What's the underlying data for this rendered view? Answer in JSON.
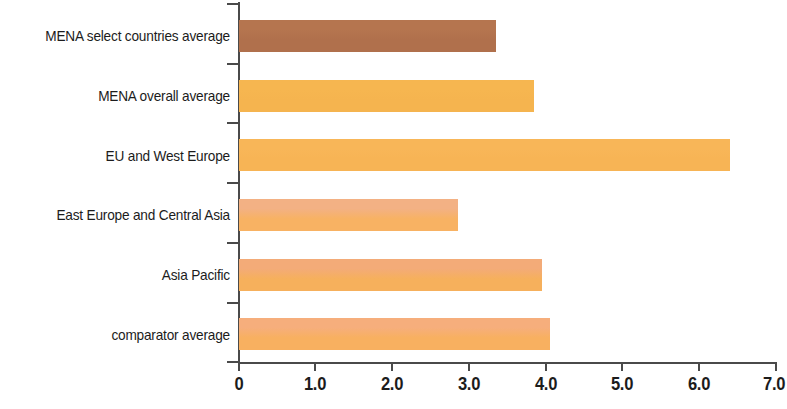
{
  "chart_data": {
    "type": "bar",
    "orientation": "horizontal",
    "title": "",
    "subtitle": "",
    "xlabel": "",
    "ylabel": "",
    "xlim": [
      0,
      7.0
    ],
    "grid": false,
    "legend": "none",
    "xticks": [
      "0",
      "1.0",
      "2.0",
      "3.0",
      "4.0",
      "5.0",
      "6.0",
      "7.0"
    ],
    "xtick_values": [
      0,
      1.0,
      2.0,
      3.0,
      4.0,
      5.0,
      6.0,
      7.0
    ],
    "categories": [
      "MENA select countries average",
      "MENA overall average",
      "EU and West Europe",
      "East Europe and Central Asia",
      "Asia Pacific",
      "comparator average"
    ],
    "values": [
      3.35,
      3.85,
      6.4,
      2.85,
      3.95,
      4.05
    ],
    "bar_colors": [
      "#b0704c",
      "#f5b44f",
      "#f7b455",
      "#f8b263",
      "#f6b05c",
      "#f8b060"
    ],
    "bar_top_colors": [
      "#b5754f",
      "#f6b650",
      "#f8b658",
      "#f3b184",
      "#f3ab78",
      "#f6ae7c"
    ],
    "bars": [
      {
        "label": "MENA select countries average",
        "value": 3.35,
        "color": "#b0704c",
        "top_color": "#b5754f"
      },
      {
        "label": "MENA overall average",
        "value": 3.85,
        "color": "#f5b44f",
        "top_color": "#f6b650"
      },
      {
        "label": "EU and West Europe",
        "value": 6.4,
        "color": "#f7b455",
        "top_color": "#f8b658"
      },
      {
        "label": "East Europe and Central Asia",
        "value": 2.85,
        "color": "#f8b263",
        "top_color": "#f3b184"
      },
      {
        "label": "Asia Pacific",
        "value": 3.95,
        "color": "#f6b05c",
        "top_color": "#f3ab78"
      },
      {
        "label": "comparator average",
        "value": 4.05,
        "color": "#f8b060",
        "top_color": "#f6ae7c"
      }
    ]
  },
  "axis": {
    "line_color": "#4a4a4a",
    "label_color": "#1c1c1c"
  }
}
